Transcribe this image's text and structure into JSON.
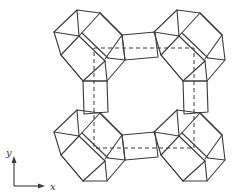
{
  "figure": {
    "axes": {
      "x_label": "x",
      "y_label": "y"
    },
    "colors": {
      "line": "#3a3a3a",
      "background": "#ffffff"
    },
    "cages": [
      {
        "name": "top-left-cage"
      },
      {
        "name": "top-right-cage"
      },
      {
        "name": "bottom-left-cage"
      },
      {
        "name": "bottom-right-cage"
      }
    ]
  }
}
